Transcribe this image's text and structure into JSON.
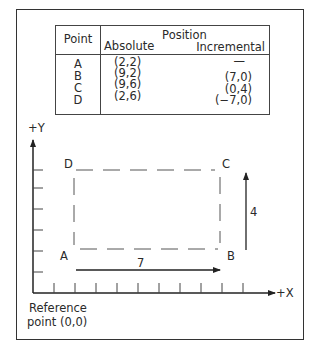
{
  "table": {
    "headers": {
      "point": "Point",
      "position": "Position",
      "absolute": "Absolute",
      "incremental": "Incremental"
    },
    "rows": [
      {
        "point": "A",
        "absolute": "(2,2)",
        "incremental": "—"
      },
      {
        "point": "B",
        "absolute": "(9,2)",
        "incremental": "(7,0)"
      },
      {
        "point": "C",
        "absolute": "(9,6)",
        "incremental": "(0,4)"
      },
      {
        "point": "D",
        "absolute": "(2,6)",
        "incremental": "(−7,0)"
      }
    ]
  },
  "diagram": {
    "y_axis_label": "+Y",
    "x_axis_label": "+X",
    "reference_label_line1": "Reference",
    "reference_label_line2": "point (0,0)",
    "points": {
      "A": "A",
      "B": "B",
      "C": "C",
      "D": "D"
    },
    "dimension_x": "7",
    "dimension_y": "4",
    "grid_unit": 1,
    "x_ticks": 10,
    "y_ticks": 6
  }
}
